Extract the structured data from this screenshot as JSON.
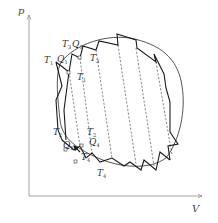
{
  "diagram": {
    "type": "p-V thermodynamic cycle decomposed into small Carnot cycles",
    "axes": {
      "y_label": "p",
      "x_label": "V"
    },
    "labels": [
      {
        "id": "T1_top_left",
        "text": "T",
        "sub": "1"
      },
      {
        "id": "Q1_top",
        "text": "Q",
        "sub": "1"
      },
      {
        "id": "T3_top",
        "text": "T",
        "sub": "3"
      },
      {
        "id": "Q3_top",
        "text": "Q",
        "sub": "3"
      },
      {
        "id": "T3_right",
        "text": "T",
        "sub": "3"
      },
      {
        "id": "T1_mid",
        "text": "T",
        "sub": "1"
      },
      {
        "id": "T2_left",
        "text": "T",
        "sub": "2"
      },
      {
        "id": "T2_right",
        "text": "T",
        "sub": "2"
      },
      {
        "id": "Q2_bottom",
        "text": "Q",
        "sub": "2"
      },
      {
        "id": "Q4_bottom",
        "text": "Q",
        "sub": "4"
      },
      {
        "id": "T4_bottom",
        "text": "T",
        "sub": "4"
      },
      {
        "id": "T4_right",
        "text": "T",
        "sub": "4"
      }
    ],
    "colors": {
      "line": "#1a1a1a",
      "axis": "#9a9a9a",
      "dashed": "#555555"
    }
  }
}
